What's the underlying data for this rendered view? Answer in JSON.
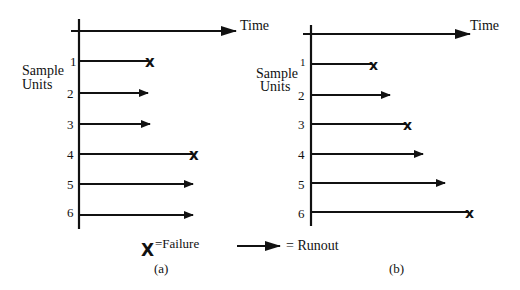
{
  "diagram": {
    "type": "survival-data-timeline",
    "colors": {
      "ink": "#111111",
      "background": "#ffffff"
    },
    "axis_label_time": "Time",
    "axis_label_units_line1": "Sample",
    "axis_label_units_line2": "Units",
    "panels": [
      {
        "id": "a",
        "caption": "(a)",
        "units": [
          {
            "label": "1",
            "outcome": "failure",
            "end": 150
          },
          {
            "label": "2",
            "outcome": "runout",
            "end": 148
          },
          {
            "label": "3",
            "outcome": "runout",
            "end": 150
          },
          {
            "label": "4",
            "outcome": "failure",
            "end": 195
          },
          {
            "label": "5",
            "outcome": "runout",
            "end": 193
          },
          {
            "label": "6",
            "outcome": "runout",
            "end": 193
          }
        ]
      },
      {
        "id": "b",
        "caption": "(b)",
        "units": [
          {
            "label": "1",
            "outcome": "failure",
            "end": 374
          },
          {
            "label": "2",
            "outcome": "runout",
            "end": 390
          },
          {
            "label": "3",
            "outcome": "failure",
            "end": 408
          },
          {
            "label": "4",
            "outcome": "runout",
            "end": 423
          },
          {
            "label": "5",
            "outcome": "runout",
            "end": 445
          },
          {
            "label": "6",
            "outcome": "failure",
            "end": 471
          }
        ]
      }
    ],
    "legend": {
      "failure_symbol": "X",
      "failure_label": "=Failure",
      "runout_label": "= Runout"
    }
  }
}
